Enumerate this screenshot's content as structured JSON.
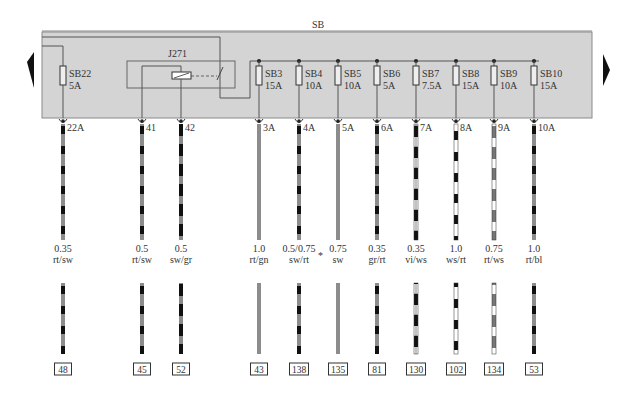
{
  "diagram": {
    "panel_label": "SB",
    "relay": {
      "label": "J271"
    },
    "colors": {
      "panel_fill": "#d4d4d4",
      "panel_border": "#8a8a8a",
      "line": "#555555",
      "wire_red": "#8c8c8c",
      "wire_black": "#111111",
      "wire_white": "#ffffff",
      "wire_grey": "#8a8a8a",
      "wire_violet": "#111111",
      "wire_blue": "#777777"
    },
    "nav": {
      "left_arrow": "previous-page",
      "right_arrow": "next-page"
    },
    "fuses": [
      {
        "id": "SB22",
        "rating": "5A",
        "x": 63
      },
      {
        "id": "SB3",
        "rating": "15A",
        "x": 259
      },
      {
        "id": "SB4",
        "rating": "10A",
        "x": 299
      },
      {
        "id": "SB5",
        "rating": "10A",
        "x": 338
      },
      {
        "id": "SB6",
        "rating": "5A",
        "x": 377
      },
      {
        "id": "SB7",
        "rating": "7.5A",
        "x": 416
      },
      {
        "id": "SB8",
        "rating": "15A",
        "x": 456
      },
      {
        "id": "SB9",
        "rating": "10A",
        "x": 494
      },
      {
        "id": "SB10",
        "rating": "15A",
        "x": 534
      }
    ],
    "wires": [
      {
        "pin": "22A",
        "size": "0.35",
        "color": "rt/sw",
        "ref": "48",
        "x": 63,
        "pattern": "red-black"
      },
      {
        "pin": "41",
        "size": "0.5",
        "color": "rt/sw",
        "ref": "45",
        "x": 142,
        "pattern": "red-black"
      },
      {
        "pin": "42",
        "size": "0.5",
        "color": "sw/gr",
        "ref": "52",
        "x": 181,
        "pattern": "black-grey"
      },
      {
        "pin": "3A",
        "size": "1.0",
        "color": "rt/gn",
        "ref": "43",
        "x": 259,
        "pattern": "solid-grey"
      },
      {
        "pin": "4A",
        "size": "0.5/0.75",
        "color": "sw/rt",
        "ref": "138",
        "x": 299,
        "pattern": "red-black",
        "note": "*"
      },
      {
        "pin": "5A",
        "size": "0.75",
        "color": "sw",
        "ref": "135",
        "x": 338,
        "pattern": "solid-grey"
      },
      {
        "pin": "6A",
        "size": "0.35",
        "color": "gr/rt",
        "ref": "81",
        "x": 377,
        "pattern": "red-black"
      },
      {
        "pin": "7A",
        "size": "0.35",
        "color": "vi/ws",
        "ref": "130",
        "x": 416,
        "pattern": "black-white"
      },
      {
        "pin": "8A",
        "size": "1.0",
        "color": "ws/rt",
        "ref": "102",
        "x": 456,
        "pattern": "white-black"
      },
      {
        "pin": "9A",
        "size": "0.75",
        "color": "rt/ws",
        "ref": "134",
        "x": 494,
        "pattern": "grey-white"
      },
      {
        "pin": "10A",
        "size": "1.0",
        "color": "rt/bl",
        "ref": "53",
        "x": 534,
        "pattern": "red-black"
      }
    ]
  }
}
